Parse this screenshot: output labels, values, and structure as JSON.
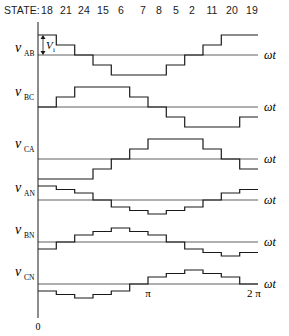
{
  "header": {
    "state_label": "STATE:",
    "states": [
      "18",
      "21",
      "24",
      "15",
      "6",
      "7",
      "8",
      "5",
      "2",
      "11",
      "20",
      "19"
    ]
  },
  "axis": {
    "origin_label": "0",
    "pi_label": "π",
    "two_pi_label": "2 π",
    "x_label": "ωt",
    "step_annotation": "V",
    "step_annotation_sub": "i"
  },
  "colors": {
    "line": "#1a1a1a",
    "background": "#ffffff"
  },
  "chart_data": {
    "type": "line",
    "title": "",
    "xlabel": "ωt",
    "ylabel": "",
    "x_range": [
      0,
      "2π"
    ],
    "x_ticks": [
      "0",
      "π",
      "2π"
    ],
    "segments": 12,
    "states": [
      "18",
      "21",
      "24",
      "15",
      "6",
      "7",
      "8",
      "5",
      "2",
      "11",
      "20",
      "19"
    ],
    "unit": "Vi",
    "series": [
      {
        "name": "vAB",
        "label": "v",
        "sub": "AB",
        "values": [
          2,
          1,
          0,
          -1,
          -2,
          -2,
          -2,
          -1,
          0,
          1,
          2,
          2
        ]
      },
      {
        "name": "vBC",
        "label": "v",
        "sub": "BC",
        "values": [
          0,
          1,
          2,
          2,
          2,
          1,
          0,
          -1,
          -2,
          -2,
          -2,
          -1
        ]
      },
      {
        "name": "vCA",
        "label": "v",
        "sub": "CA",
        "values": [
          -2,
          -2,
          -2,
          -1,
          0,
          1,
          2,
          2,
          2,
          1,
          0,
          -1
        ]
      },
      {
        "name": "vAN",
        "label": "v",
        "sub": "AN",
        "values": [
          1.333,
          1,
          0.667,
          0,
          -0.667,
          -1,
          -1.333,
          -1,
          -0.667,
          0,
          0.667,
          1
        ]
      },
      {
        "name": "vBN",
        "label": "v",
        "sub": "BN",
        "values": [
          -0.667,
          0,
          0.667,
          1,
          1.333,
          1,
          0.667,
          0,
          -0.667,
          -1,
          -1.333,
          -1
        ]
      },
      {
        "name": "vCN",
        "label": "v",
        "sub": "CN",
        "values": [
          -0.667,
          -1,
          -1.333,
          -1,
          -0.667,
          0,
          0.667,
          1,
          1.333,
          1,
          0.667,
          0
        ]
      }
    ]
  }
}
